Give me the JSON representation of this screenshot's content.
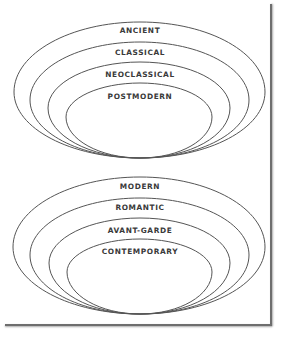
{
  "diagram": {
    "type": "nested-egg-rings",
    "groups": [
      {
        "name": "upper",
        "rings": [
          {
            "label": "ANCIENT",
            "left": 14,
            "right": 265,
            "top": 22,
            "bottom": 158,
            "mid": 92,
            "label_y": 33
          },
          {
            "label": "CLASSICAL",
            "left": 30,
            "right": 249,
            "top": 42,
            "bottom": 158,
            "mid": 100,
            "label_y": 55
          },
          {
            "label": "NEOCLASSICAL",
            "left": 48,
            "right": 230,
            "top": 62,
            "bottom": 158,
            "mid": 108,
            "label_y": 77
          },
          {
            "label": "POSTMODERN",
            "left": 66,
            "right": 212,
            "top": 83,
            "bottom": 158,
            "mid": 117,
            "label_y": 99
          }
        ]
      },
      {
        "name": "lower",
        "rings": [
          {
            "label": "MODERN",
            "left": 13,
            "right": 265,
            "top": 177,
            "bottom": 314,
            "mid": 247,
            "label_y": 189
          },
          {
            "label": "ROMANTIC",
            "left": 30,
            "right": 249,
            "top": 198,
            "bottom": 314,
            "mid": 255,
            "label_y": 210
          },
          {
            "label": "AVANT-GARDE",
            "left": 49,
            "right": 230,
            "top": 218,
            "bottom": 314,
            "mid": 263,
            "label_y": 233
          },
          {
            "label": "CONTEMPORARY",
            "left": 67,
            "right": 212,
            "top": 239,
            "bottom": 314,
            "mid": 272,
            "label_y": 254
          }
        ]
      }
    ],
    "colors": {
      "stroke": "#555555",
      "text": "#3a3a3a",
      "frame": "#6e6e6e",
      "background": "#ffffff"
    }
  }
}
